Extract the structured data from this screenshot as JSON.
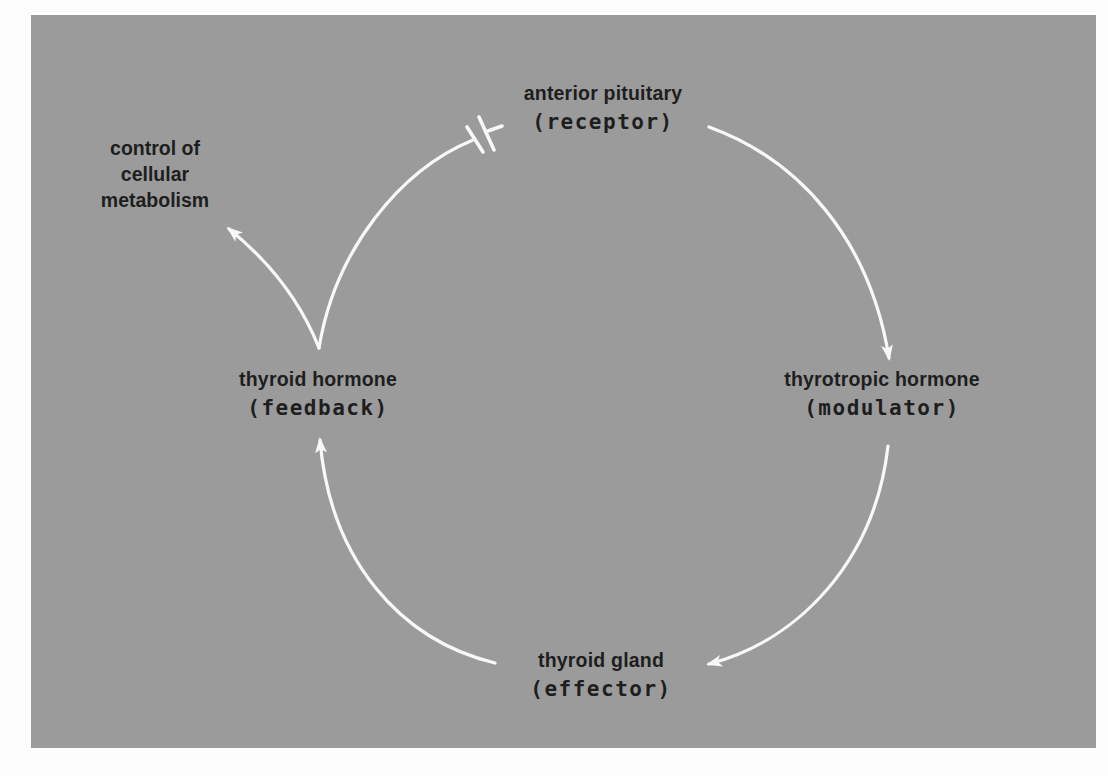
{
  "diagram": {
    "type": "feedback-loop",
    "colors": {
      "background": "#9b9b9b",
      "page": "#fdfdfd",
      "arrow": "#f8f8f8",
      "text": "#1e1e1e"
    },
    "nodes": {
      "receptor": {
        "name": "anterior pituitary",
        "role": "(receptor)"
      },
      "modulator": {
        "name": "thyrotropic hormone",
        "role": "(modulator)"
      },
      "effector": {
        "name": "thyroid gland",
        "role": "(effector)"
      },
      "feedback": {
        "name": "thyroid hormone",
        "role": "(feedback)"
      }
    },
    "outcome": {
      "lines": [
        "control of",
        "cellular",
        "metabolism"
      ]
    },
    "edges": [
      {
        "from": "receptor",
        "to": "modulator",
        "type": "arrow"
      },
      {
        "from": "modulator",
        "to": "effector",
        "type": "arrow"
      },
      {
        "from": "effector",
        "to": "feedback",
        "type": "arrow"
      },
      {
        "from": "feedback",
        "to": "receptor",
        "type": "inhibition"
      },
      {
        "from": "feedback",
        "to": "outcome",
        "type": "arrow"
      }
    ]
  }
}
